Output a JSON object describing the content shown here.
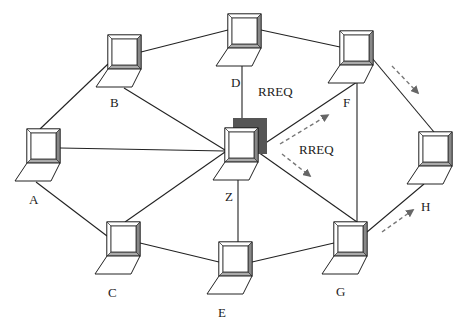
{
  "diagram": {
    "type": "AODV route request flooding (ad hoc network)",
    "nodes": [
      {
        "id": "A",
        "label": "A",
        "x": 27,
        "y": 129
      },
      {
        "id": "B",
        "label": "B",
        "x": 108,
        "y": 35
      },
      {
        "id": "C",
        "label": "C",
        "x": 107,
        "y": 222
      },
      {
        "id": "D",
        "label": "D",
        "x": 228,
        "y": 14
      },
      {
        "id": "E",
        "label": "E",
        "x": 219,
        "y": 242
      },
      {
        "id": "F",
        "label": "F",
        "x": 340,
        "y": 31
      },
      {
        "id": "G",
        "label": "G",
        "x": 334,
        "y": 222
      },
      {
        "id": "H",
        "label": "H",
        "x": 419,
        "y": 132
      },
      {
        "id": "Z",
        "label": "Z",
        "x": 225,
        "y": 128,
        "highlighted": true
      }
    ],
    "links": [
      [
        "A",
        "B"
      ],
      [
        "A",
        "Z"
      ],
      [
        "A",
        "C"
      ],
      [
        "B",
        "D"
      ],
      [
        "B",
        "Z"
      ],
      [
        "C",
        "Z"
      ],
      [
        "C",
        "E"
      ],
      [
        "D",
        "F"
      ],
      [
        "D",
        "Z"
      ],
      [
        "E",
        "Z"
      ],
      [
        "E",
        "G"
      ],
      [
        "F",
        "Z"
      ],
      [
        "F",
        "H"
      ],
      [
        "F",
        "G"
      ],
      [
        "Z",
        "G"
      ],
      [
        "G",
        "H"
      ]
    ],
    "messages": [
      {
        "label": "RREQ",
        "from": "Z",
        "to": "F"
      },
      {
        "label": "RREQ",
        "from": "Z",
        "to": "G"
      },
      {
        "label": "",
        "from": "F",
        "to": "H"
      },
      {
        "label": "",
        "from": "G",
        "to": "H"
      }
    ],
    "rreq_labels": [
      "RREQ",
      "RREQ"
    ],
    "colors": {
      "line": "#222222",
      "highlight": "#555555",
      "arrow": "#666666"
    }
  }
}
